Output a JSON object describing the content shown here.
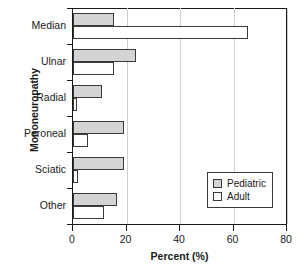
{
  "chart_data": {
    "type": "bar",
    "orientation": "horizontal",
    "title": "",
    "xlabel": "Percent (%)",
    "ylabel": "Mononeuropathy",
    "xlim": [
      0,
      80
    ],
    "xticks": [
      0,
      20,
      40,
      60,
      80
    ],
    "xtick_labels": [
      "0",
      "20",
      "40",
      "60",
      "80"
    ],
    "grid": "vertical",
    "legend_position": "lower-right",
    "categories": [
      "Median",
      "Ulnar",
      "Radial",
      "Peroneal",
      "Sciatic",
      "Other"
    ],
    "series": [
      {
        "name": "Pediatric",
        "color": "#d4d4d4",
        "values": [
          15.5,
          23.5,
          11.0,
          19.0,
          19.0,
          16.5
        ]
      },
      {
        "name": "Adult",
        "color": "#ffffff",
        "values": [
          65.5,
          15.5,
          1.5,
          5.5,
          1.8,
          11.5
        ]
      }
    ]
  },
  "legend": {
    "entries": [
      {
        "label": "Pediatric",
        "swatch": "pediatric"
      },
      {
        "label": "Adult",
        "swatch": "adult"
      }
    ]
  }
}
